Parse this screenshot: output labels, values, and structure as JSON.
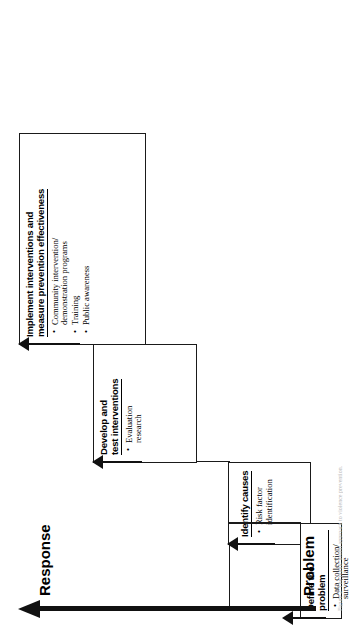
{
  "figure": {
    "type": "staircase-process-diagram",
    "orientation": "rotated-90-ccw",
    "caption": "Figure 2. The public health approach to violence prevention."
  },
  "axis": {
    "start_label": "Problem",
    "end_label": "Response",
    "direction": "upward-arrow"
  },
  "steps": [
    {
      "id": "define-the-problem",
      "order": 1,
      "title": "Define the problem",
      "bullets": [
        "Data collection/\nsurveillance"
      ]
    },
    {
      "id": "identify-causes",
      "order": 2,
      "title": "Identify causes",
      "bullets": [
        "Risk factor\nidentification"
      ]
    },
    {
      "id": "develop-and-test-interventions",
      "order": 3,
      "title": "Develop and\ntest interventions",
      "bullets": [
        "Evaluation\nresearch"
      ]
    },
    {
      "id": "implement-interventions",
      "order": 4,
      "title": "Implement interventions and\nmeasure prevention effectiveness",
      "bullets": [
        "Community intervention/\ndemonstration programs",
        "Training",
        "Public awareness"
      ]
    }
  ],
  "colors": {
    "ink": "#1a1a1a",
    "background": "#ffffff",
    "caption": "#b9b9b9"
  }
}
